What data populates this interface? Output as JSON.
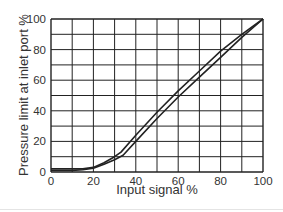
{
  "chart_data": {
    "type": "line",
    "title": "",
    "xlabel": "Input signal %",
    "ylabel": "Pressure limit at inlet port %",
    "xlim": [
      0,
      100
    ],
    "ylim": [
      0,
      100
    ],
    "xticks": [
      0,
      20,
      40,
      60,
      80,
      100
    ],
    "yticks": [
      0,
      20,
      40,
      60,
      80,
      100
    ],
    "grid": true,
    "grid_step": 10,
    "legend": null,
    "series": [
      {
        "name": "upper limit",
        "x": [
          0,
          10,
          15,
          20,
          25,
          30,
          33,
          40,
          50,
          60,
          70,
          80,
          90,
          100
        ],
        "y": [
          2,
          2,
          2,
          3,
          6,
          10,
          13,
          24,
          39,
          53,
          66,
          79,
          90,
          100
        ]
      },
      {
        "name": "lower limit",
        "x": [
          0,
          10,
          15,
          20,
          25,
          30,
          34,
          40,
          50,
          60,
          70,
          80,
          90,
          100
        ],
        "y": [
          1,
          1,
          1.5,
          2.5,
          5,
          8,
          11,
          20,
          35,
          49,
          62,
          75,
          88,
          100
        ]
      }
    ],
    "colors": {
      "line": "#222222",
      "grid": "#222222",
      "text": "#333333"
    }
  }
}
